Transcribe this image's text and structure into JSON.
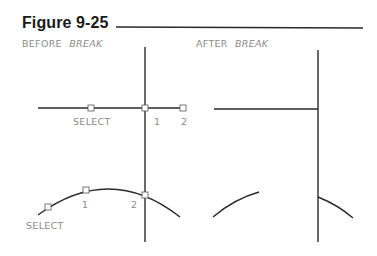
{
  "figure": {
    "title": "Figure 9-25",
    "rule_color": "#222222"
  },
  "panels": {
    "before": {
      "label_prefix": "BEFORE",
      "label_command": "BREAK",
      "line_example": {
        "select_label": "SELECT",
        "point1_label": "1",
        "point2_label": "2"
      },
      "arc_example": {
        "select_label": "SELECT",
        "point1_label": "1",
        "point2_label": "2"
      }
    },
    "after": {
      "label_prefix": "AFTER",
      "label_command": "BREAK"
    }
  },
  "colors": {
    "line": "#2a2a2a",
    "label_text": "#8a8a8a",
    "title_text": "#1a1a1a"
  }
}
